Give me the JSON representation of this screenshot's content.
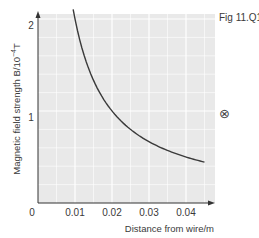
{
  "figure_label": "Fig 11.Q1",
  "into_page_symbol": "⊗",
  "chart_data": {
    "type": "line",
    "title": "",
    "xlabel": "Distance from wire/m",
    "ylabel": "Magnetic field strength B/10⁻⁴T",
    "ylabel_main": "Magnetic field strength B/10",
    "ylabel_exp": "−4",
    "ylabel_unit": "T",
    "xlim": [
      0,
      0.046
    ],
    "ylim": [
      0,
      2.1
    ],
    "grid": true,
    "x_tick_labels": [
      "0",
      "0.01",
      "0.02",
      "0.03",
      "0.04"
    ],
    "y_tick_labels": [
      "1",
      "2"
    ],
    "series": [
      {
        "name": "B vs distance",
        "x": [
          0.0095,
          0.01,
          0.0125,
          0.015,
          0.0175,
          0.02,
          0.025,
          0.03,
          0.035,
          0.04,
          0.045
        ],
        "values": [
          2.1,
          2.0,
          1.6,
          1.33,
          1.14,
          1.0,
          0.8,
          0.67,
          0.57,
          0.5,
          0.44
        ]
      }
    ]
  }
}
